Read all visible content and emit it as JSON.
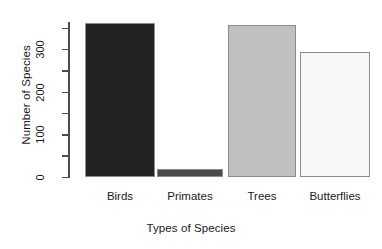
{
  "chart_data": {
    "type": "bar",
    "title": "",
    "xlabel": "Types of Species",
    "ylabel": "Number of Species",
    "categories": [
      "Birds",
      "Primates",
      "Trees",
      "Butterflies"
    ],
    "values": [
      362,
      21,
      358,
      295
    ],
    "ylim": [
      0,
      365
    ],
    "yticks": [
      0,
      50,
      100,
      150,
      200,
      250,
      300,
      350
    ],
    "ytick_labels": [
      "0",
      "",
      "100",
      "",
      "200",
      "",
      "300",
      ""
    ],
    "grid": false,
    "legend": null,
    "bar_colors": [
      "#232323",
      "#4a4a4a",
      "#c0c0c0",
      "#f7f7f7"
    ],
    "bar_border_color": "#8c8c8c",
    "axis_color": "#4c4c4c",
    "text_color": "#1a1a1a",
    "background": "#ffffff"
  },
  "axes": {
    "y_title": "Number of Species",
    "x_title": "Types of Species"
  }
}
